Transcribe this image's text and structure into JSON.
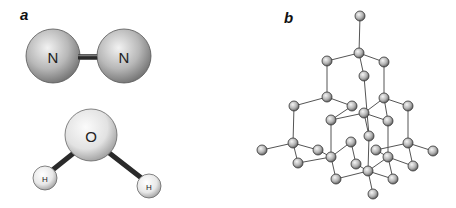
{
  "figure": {
    "panels": [
      {
        "id": "a",
        "label": "a",
        "x": 20,
        "y": 20
      },
      {
        "id": "b",
        "label": "b",
        "x": 284,
        "y": 23
      }
    ],
    "nitrogen_molecule": {
      "atoms": [
        {
          "symbol": "N",
          "cx": 53,
          "cy": 56,
          "r": 27
        },
        {
          "symbol": "N",
          "cx": 124,
          "cy": 56,
          "r": 27
        }
      ],
      "bond": {
        "x1": 72,
        "y1": 57,
        "x2": 100,
        "y2": 57
      }
    },
    "water_molecule": {
      "atoms": [
        {
          "symbol": "O",
          "cx": 91,
          "cy": 135,
          "r": 26
        },
        {
          "symbol": "H",
          "cx": 45,
          "cy": 178,
          "r": 12
        },
        {
          "symbol": "H",
          "cx": 149,
          "cy": 186,
          "r": 12
        }
      ],
      "bonds": [
        {
          "x1": 75,
          "y1": 152,
          "x2": 50,
          "y2": 172
        },
        {
          "x1": 108,
          "y1": 152,
          "x2": 144,
          "y2": 180
        }
      ]
    },
    "diamond_lattice": {
      "atom_radius": 5,
      "atoms": [
        [
          360,
          16
        ],
        [
          359,
          53
        ],
        [
          327,
          61
        ],
        [
          384,
          62
        ],
        [
          364,
          76
        ],
        [
          327,
          97
        ],
        [
          384,
          98
        ],
        [
          294,
          106
        ],
        [
          352,
          106
        ],
        [
          408,
          106
        ],
        [
          364,
          113
        ],
        [
          331,
          120
        ],
        [
          388,
          121
        ],
        [
          369,
          136
        ],
        [
          262,
          150
        ],
        [
          293,
          143
        ],
        [
          318,
          150
        ],
        [
          351,
          142
        ],
        [
          376,
          150
        ],
        [
          408,
          143
        ],
        [
          433,
          151
        ],
        [
          298,
          163
        ],
        [
          331,
          157
        ],
        [
          356,
          164
        ],
        [
          388,
          157
        ],
        [
          413,
          166
        ],
        [
          368,
          171
        ],
        [
          336,
          179
        ],
        [
          393,
          179
        ],
        [
          373,
          194
        ]
      ],
      "bonds": [
        [
          0,
          1
        ],
        [
          1,
          2
        ],
        [
          1,
          3
        ],
        [
          1,
          4
        ],
        [
          2,
          5
        ],
        [
          3,
          6
        ],
        [
          4,
          13
        ],
        [
          5,
          7
        ],
        [
          5,
          8
        ],
        [
          6,
          9
        ],
        [
          6,
          12
        ],
        [
          6,
          10
        ],
        [
          8,
          11
        ],
        [
          10,
          11
        ],
        [
          10,
          12
        ],
        [
          10,
          13
        ],
        [
          7,
          15
        ],
        [
          11,
          22
        ],
        [
          12,
          24
        ],
        [
          9,
          19
        ],
        [
          15,
          14
        ],
        [
          15,
          16
        ],
        [
          15,
          21
        ],
        [
          16,
          22
        ],
        [
          22,
          17
        ],
        [
          17,
          23
        ],
        [
          22,
          27
        ],
        [
          19,
          18
        ],
        [
          19,
          20
        ],
        [
          19,
          25
        ],
        [
          24,
          18
        ],
        [
          24,
          28
        ],
        [
          24,
          26
        ],
        [
          13,
          26
        ],
        [
          21,
          22
        ],
        [
          23,
          26
        ],
        [
          26,
          29
        ],
        [
          27,
          26
        ],
        [
          25,
          24
        ],
        [
          28,
          26
        ]
      ]
    }
  }
}
